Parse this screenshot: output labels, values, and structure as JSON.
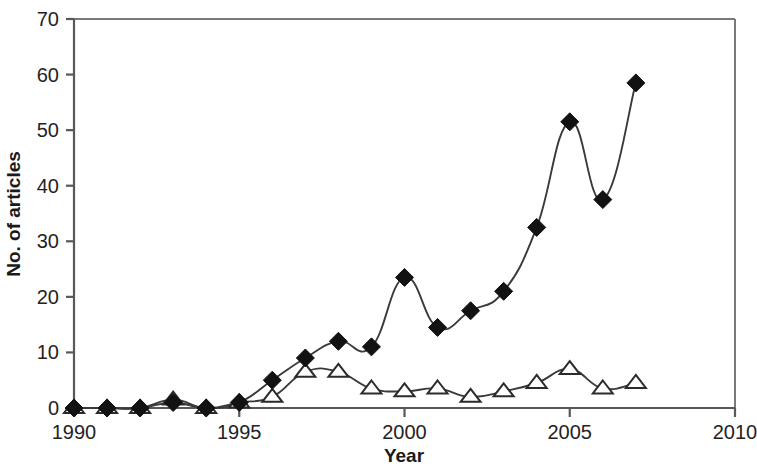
{
  "chart_data": {
    "type": "line",
    "title": "",
    "subtitle": "",
    "xlabel": "Year",
    "ylabel": "No. of articles",
    "xlim": [
      1990,
      2010
    ],
    "ylim": [
      0,
      70
    ],
    "xticks": [
      1990,
      1995,
      2000,
      2005,
      2010
    ],
    "xtick_labels": [
      "1990",
      "1995",
      "2000",
      "2005",
      "2010"
    ],
    "yticks": [
      0,
      10,
      20,
      30,
      40,
      50,
      60,
      70
    ],
    "ytick_labels": [
      "0",
      "10",
      "20",
      "30",
      "40",
      "50",
      "60",
      "70"
    ],
    "grid": false,
    "legend_position": "none",
    "x": [
      1990,
      1991,
      1992,
      1993,
      1994,
      1995,
      1996,
      1997,
      1998,
      1999,
      2000,
      2001,
      2002,
      2003,
      2004,
      2005,
      2006,
      2007
    ],
    "series": [
      {
        "name": "filled-diamond-series",
        "marker": "diamond",
        "marker_fill": "#121212",
        "line_color": "#3a3a3a",
        "values": [
          0,
          0,
          0,
          1,
          0,
          1,
          5,
          9,
          12,
          11,
          23.5,
          14.5,
          17.5,
          21,
          32.5,
          51.5,
          37.5,
          58.5
        ]
      },
      {
        "name": "open-triangle-series",
        "marker": "triangle",
        "marker_fill": "#ffffff",
        "line_color": "#2b2b2b",
        "values": [
          0,
          0,
          0,
          1.5,
          0,
          1,
          2,
          6.5,
          6.5,
          3.5,
          3,
          3.5,
          2,
          3,
          4.5,
          7,
          3.5,
          4.5
        ]
      }
    ]
  },
  "axis": {
    "x_label": "Year",
    "y_label": "No. of articles"
  }
}
